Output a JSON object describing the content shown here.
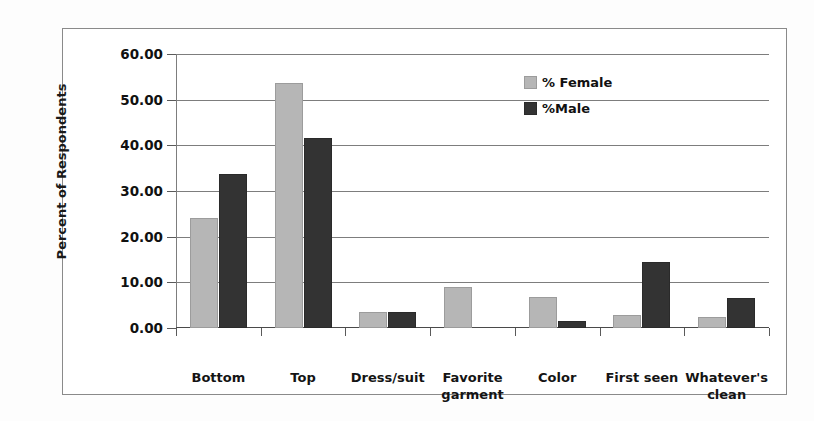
{
  "chart_data": {
    "type": "bar",
    "title": "",
    "xlabel": "",
    "ylabel": "Percent of Respondents",
    "ylim": [
      0,
      60
    ],
    "ytick_step": 10,
    "ytick_labels": [
      "0.00",
      "10.00",
      "20.00",
      "30.00",
      "40.00",
      "50.00",
      "60.00"
    ],
    "ytick_values": [
      0,
      10,
      20,
      30,
      40,
      50,
      60
    ],
    "grid": true,
    "legend_position": "top-right",
    "categories": [
      "Bottom",
      "Top",
      "Dress/suit",
      "Favorite garment",
      "Color",
      "First seen",
      "Whatever's clean"
    ],
    "category_lines": [
      [
        "Bottom"
      ],
      [
        "Top"
      ],
      [
        "Dress/suit"
      ],
      [
        "Favorite",
        "garment"
      ],
      [
        "Color"
      ],
      [
        "First seen"
      ],
      [
        "Whatever's",
        "clean"
      ]
    ],
    "series": [
      {
        "name": "% Female",
        "color": "#b6b6b6",
        "values": [
          24.2,
          53.7,
          3.4,
          8.9,
          6.7,
          2.8,
          2.5
        ]
      },
      {
        "name": "%Male",
        "color": "#333333",
        "values": [
          33.8,
          41.5,
          3.4,
          0,
          1.6,
          14.4,
          6.5
        ]
      }
    ]
  },
  "legend": {
    "items": [
      {
        "label": "% Female",
        "swatch": "female"
      },
      {
        "label": "%Male",
        "swatch": "male"
      }
    ]
  }
}
